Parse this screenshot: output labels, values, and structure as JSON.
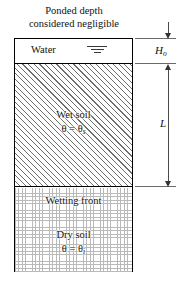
{
  "caption": {
    "line1": "Ponded depth",
    "line2": "considered negligible"
  },
  "profile": {
    "water": {
      "label": "Water",
      "symbol": "water-table-icon"
    },
    "wet_soil": {
      "name": "Wet soil",
      "theta": "θ",
      "equals": " = ",
      "theta_sub": "s"
    },
    "wetting_front": {
      "label": "Wetting front"
    },
    "dry_soil": {
      "name": "Dry soil",
      "theta": "θ",
      "equals": " = ",
      "theta_sub": "i"
    }
  },
  "dimensions": {
    "ponded_depth": {
      "symbol": "H",
      "subscript": "o"
    },
    "wetting_depth": {
      "symbol": "L",
      "subscript": ""
    }
  },
  "colors": {
    "outline": "#000000",
    "hatch": "#6d6d6d",
    "dots": "#b9b9b9",
    "dimension": "#4a4a4a",
    "text": "#111111",
    "background": "#ffffff"
  }
}
